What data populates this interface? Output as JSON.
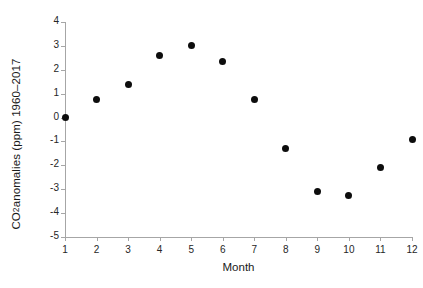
{
  "chart_data": {
    "type": "scatter",
    "title": "",
    "xlabel": "Month",
    "ylabel_prefix": "CO",
    "ylabel_sub": "2",
    "ylabel_suffix": " anomalies (ppm) 1960–2017",
    "ylabel_full": "CO2 anomalies (ppm) 1960–2017",
    "x": [
      1,
      2,
      3,
      4,
      5,
      6,
      7,
      8,
      9,
      10,
      11,
      12
    ],
    "values": [
      0.0,
      0.75,
      1.4,
      2.6,
      3.0,
      2.35,
      0.75,
      -1.3,
      -3.1,
      -3.25,
      -2.1,
      -0.9
    ],
    "categories": [
      "1",
      "2",
      "3",
      "4",
      "5",
      "6",
      "7",
      "8",
      "9",
      "10",
      "11",
      "12"
    ],
    "xlim": [
      1,
      12
    ],
    "ylim": [
      -5,
      4
    ],
    "xticks": [
      "1",
      "2",
      "3",
      "4",
      "5",
      "6",
      "7",
      "8",
      "9",
      "10",
      "11",
      "12"
    ],
    "yticks": [
      "4",
      "3",
      "2",
      "1",
      "0",
      "-1",
      "-2",
      "-3",
      "-4",
      "-5"
    ],
    "ytick_values": [
      4,
      3,
      2,
      1,
      0,
      -1,
      -2,
      -3,
      -4,
      -5
    ],
    "grid": false,
    "legend": false,
    "marker_color": "#0d0d0d",
    "axis_color": "#a6a6a6",
    "background": "#ffffff"
  }
}
